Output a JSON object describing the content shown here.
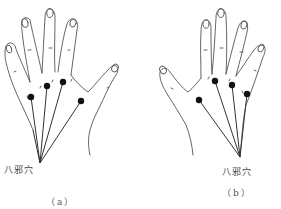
{
  "figure": {
    "panels": [
      {
        "id": "a",
        "hand": "left-hand-dorsal",
        "point_label": "八邪穴",
        "caption": "（a）",
        "points": [
          {
            "x": 31,
            "y": 97
          },
          {
            "x": 47,
            "y": 86
          },
          {
            "x": 63,
            "y": 82
          },
          {
            "x": 81,
            "y": 101
          }
        ],
        "convergence": {
          "x": 40,
          "y": 163
        }
      },
      {
        "id": "b",
        "hand": "right-hand-dorsal",
        "point_label": "八邪穴",
        "caption": "（b）",
        "points": [
          {
            "x": 199,
            "y": 100
          },
          {
            "x": 215,
            "y": 81
          },
          {
            "x": 232,
            "y": 85
          },
          {
            "x": 247,
            "y": 94
          }
        ],
        "convergence": {
          "x": 240,
          "y": 157
        }
      }
    ],
    "colors": {
      "line": "#333333",
      "dot": "#111111",
      "background": "#ffffff"
    }
  }
}
